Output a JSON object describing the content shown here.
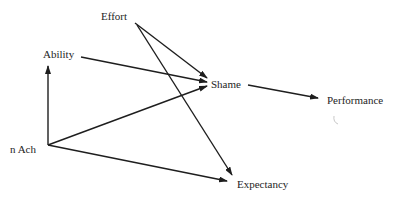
{
  "diagram": {
    "type": "path-diagram",
    "colors": {
      "stroke": "#1e1e1e",
      "text": "#1e1e1e",
      "background": "#ffffff",
      "smudge": "#c8c8c8"
    },
    "nodes": [
      {
        "id": "effort",
        "label": "Effort",
        "x": 101,
        "y": 11
      },
      {
        "id": "ability",
        "label": "Ability",
        "x": 43,
        "y": 49
      },
      {
        "id": "shame",
        "label": "Shame",
        "x": 211,
        "y": 79
      },
      {
        "id": "performance",
        "label": "Performance",
        "x": 327,
        "y": 95
      },
      {
        "id": "nach",
        "label": "n Ach",
        "x": 10,
        "y": 144
      },
      {
        "id": "expectancy",
        "label": "Expectancy",
        "x": 237,
        "y": 179
      }
    ],
    "edges": [
      {
        "from": "effort",
        "to": "shame",
        "x1": 135,
        "y1": 23,
        "x2": 207,
        "y2": 78
      },
      {
        "from": "effort",
        "to": "expectancy",
        "x1": 137,
        "y1": 25,
        "x2": 232,
        "y2": 175
      },
      {
        "from": "ability",
        "to": "shame",
        "x1": 81,
        "y1": 57,
        "x2": 207,
        "y2": 82
      },
      {
        "from": "nach",
        "to": "ability",
        "x1": 48,
        "y1": 145,
        "x2": 48,
        "y2": 66
      },
      {
        "from": "nach",
        "to": "shame",
        "x1": 48,
        "y1": 145,
        "x2": 207,
        "y2": 86
      },
      {
        "from": "nach",
        "to": "expectancy",
        "x1": 48,
        "y1": 145,
        "x2": 227,
        "y2": 181
      },
      {
        "from": "shame",
        "to": "performance",
        "x1": 248,
        "y1": 85,
        "x2": 318,
        "y2": 98
      }
    ]
  }
}
